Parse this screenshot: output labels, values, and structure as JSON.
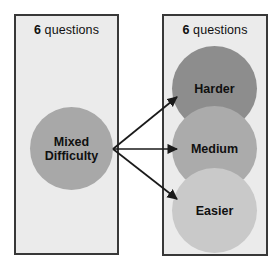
{
  "diagram": {
    "title_text": "Mixed difficulty question set split into Harder, Medium and Easier sets",
    "colors": {
      "page_background": "#ffffff",
      "panel_fill": "#ebebeb",
      "panel_border": "#383838",
      "arrow": "#1a1a1a",
      "bubble_mixed": "#a8a8a8",
      "bubble_harder": "#8d8d8d",
      "bubble_medium": "#ababab",
      "bubble_easier": "#c9c9c9",
      "label_text": "#101010"
    },
    "panels": [
      {
        "id": "source-panel",
        "caption_count": "6",
        "caption_word": "questions",
        "bubbles": [
          {
            "id": "mixed",
            "label": "Mixed\nDifficulty",
            "label_line1": "Mixed",
            "label_line2": "Difficulty",
            "fill": "#a8a8a8"
          }
        ]
      },
      {
        "id": "target-panel",
        "caption_count": "6",
        "caption_word": "questions",
        "bubbles": [
          {
            "id": "harder",
            "label": "Harder",
            "fill": "#8d8d8d"
          },
          {
            "id": "medium",
            "label": "Medium",
            "fill": "#ababab"
          },
          {
            "id": "easier",
            "label": "Easier",
            "fill": "#c9c9c9"
          }
        ]
      }
    ],
    "arrows": [
      {
        "id": "arrow-to-harder",
        "from": "mixed",
        "to": "harder",
        "x1": 113,
        "y1": 149,
        "x2": 177,
        "y2": 97
      },
      {
        "id": "arrow-to-medium",
        "from": "mixed",
        "to": "medium",
        "x1": 113,
        "y1": 149,
        "x2": 177,
        "y2": 149
      },
      {
        "id": "arrow-to-easier",
        "from": "mixed",
        "to": "easier",
        "x1": 113,
        "y1": 149,
        "x2": 177,
        "y2": 199
      }
    ]
  }
}
